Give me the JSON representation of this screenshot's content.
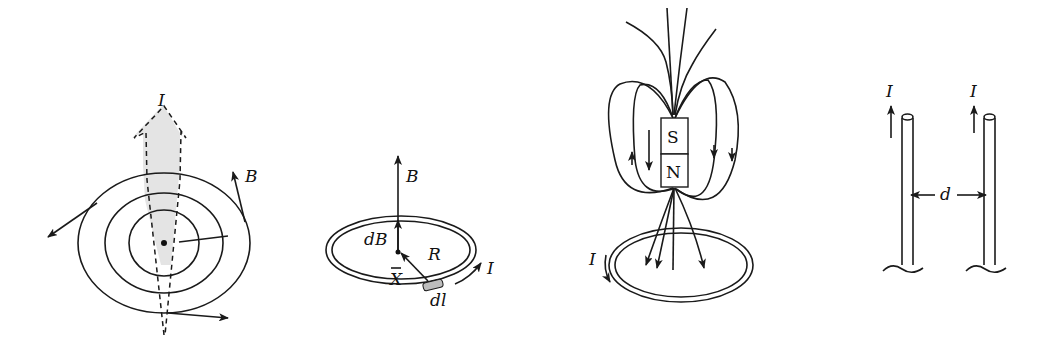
{
  "figure": {
    "panels": [
      {
        "id": "straight-wire-field",
        "labels": {
          "current": "I",
          "field": "B"
        }
      },
      {
        "id": "current-loop-axis-field",
        "labels": {
          "field": "B",
          "element_field": "dB",
          "radius": "R",
          "current": "I",
          "position": "X",
          "element": "dl"
        }
      },
      {
        "id": "magnet-and-loop",
        "labels": {
          "south": "S",
          "north": "N",
          "current": "I"
        }
      },
      {
        "id": "parallel-wires",
        "labels": {
          "current_left": "I",
          "current_right": "I",
          "separation": "d"
        }
      }
    ]
  }
}
